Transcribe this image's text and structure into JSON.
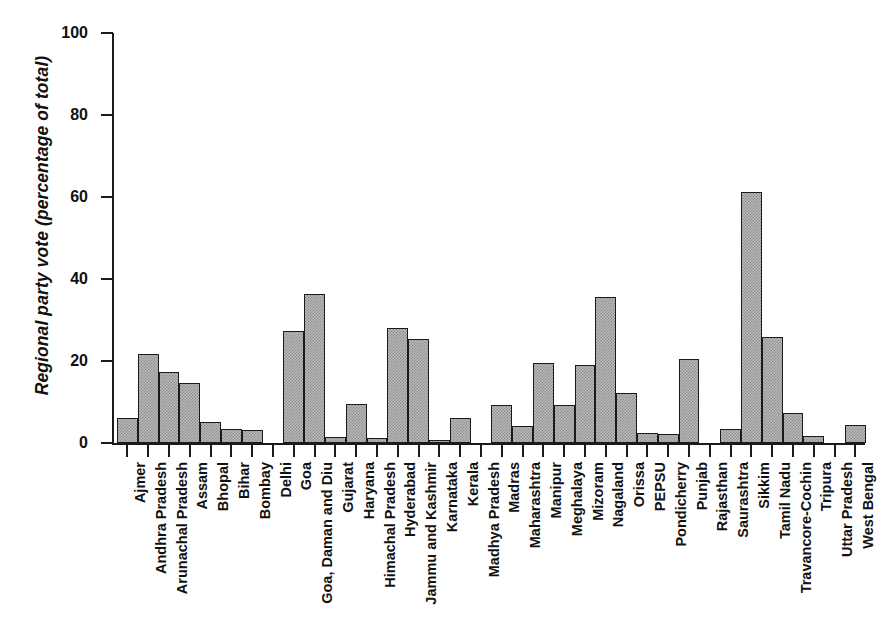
{
  "chart_data": {
    "type": "bar",
    "title": "",
    "subtitle": "",
    "xlabel": "",
    "ylabel": "Regional party vote (percentage of total)",
    "ylim": [
      0,
      100
    ],
    "yticks": [
      0,
      20,
      40,
      60,
      80,
      100
    ],
    "grid": false,
    "legend": null,
    "orientation": "vertical",
    "bar_style": {
      "fill": "#b9b9b9",
      "hatch": "dither-gray",
      "edge": "#1b1b1b"
    },
    "categories": [
      "Ajmer",
      "Andhra Pradesh",
      "Arunachal Pradesh",
      "Assam",
      "Bhopal",
      "Bihar",
      "Bombay",
      "Delhi",
      "Goa",
      "Goa, Daman and Diu",
      "Gujarat",
      "Haryana",
      "Himachal Pradesh",
      "Hyderabad",
      "Jammu and Kashmir",
      "Karnataka",
      "Kerala",
      "Madhya Pradesh",
      "Madras",
      "Maharashtra",
      "Manipur",
      "Meghalaya",
      "Mizoram",
      "Nagaland",
      "Orissa",
      "PEPSU",
      "Pondicherry",
      "Punjab",
      "Rajasthan",
      "Saurashtra",
      "Sikkim",
      "Tamil Nadu",
      "Travancore-Cochin",
      "Tripura",
      "Uttar Pradesh",
      "West Bengal"
    ],
    "values": [
      6.0,
      21.7,
      17.4,
      14.6,
      5.2,
      3.4,
      3.2,
      0.0,
      27.2,
      36.3,
      1.5,
      9.4,
      1.2,
      28.1,
      25.3,
      0.7,
      6.1,
      0.0,
      9.3,
      4.1,
      19.4,
      9.3,
      19.0,
      35.6,
      12.2,
      2.5,
      2.3,
      20.6,
      0.0,
      3.5,
      61.3,
      25.8,
      7.2,
      1.8,
      0.0,
      4.3
    ]
  }
}
